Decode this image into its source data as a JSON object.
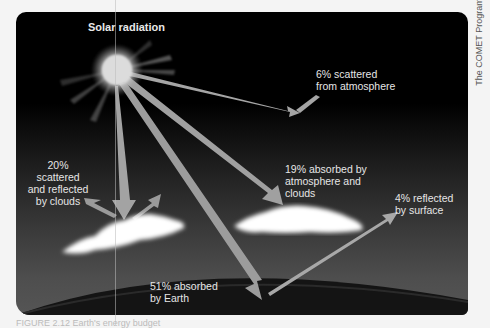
{
  "diagram": {
    "title": "Solar radiation",
    "credit": "The COMET Program",
    "labels": {
      "scattered_atmosphere": "6% scattered\nfrom  atmosphere",
      "clouds_scattered": "20% scattered\nand reflected\nby clouds",
      "absorbed_atmosphere": "19% absorbed by\natmosphere and\nclouds",
      "reflected_surface": "4% reflected\nby surface",
      "absorbed_earth": "51% absorbed\nby Earth"
    },
    "caption": "FIGURE 2.12   Earth's energy budget",
    "colors": {
      "background": "#000000",
      "arrow": "#9a9a9a",
      "cloud": "#ffffff",
      "text": "#e6e6e6",
      "earth": "#151515"
    },
    "flows": [
      {
        "name": "scattered by atmosphere",
        "percent": 6
      },
      {
        "name": "scattered and reflected by clouds",
        "percent": 20
      },
      {
        "name": "absorbed by atmosphere and clouds",
        "percent": 19
      },
      {
        "name": "reflected by surface",
        "percent": 4
      },
      {
        "name": "absorbed by Earth",
        "percent": 51
      }
    ]
  }
}
